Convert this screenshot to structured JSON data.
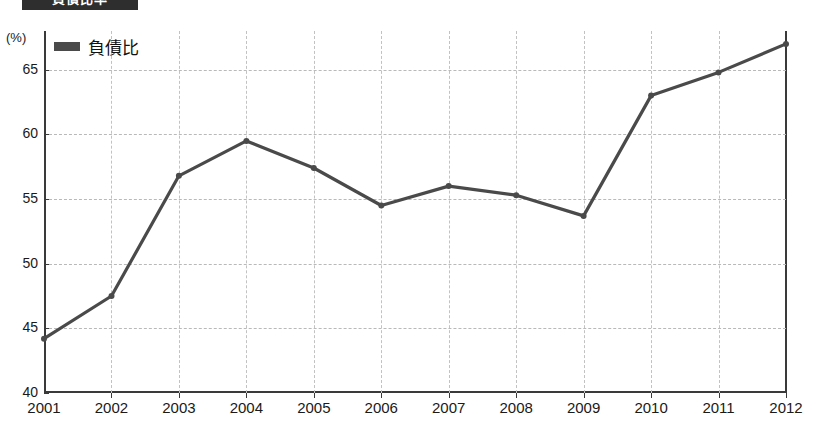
{
  "header": {
    "title_bar_text": "負債比率",
    "title_bar_color": "#2e2e2e"
  },
  "axis": {
    "unit_label": "(%)",
    "y_ticks": [
      "40",
      "45",
      "50",
      "55",
      "60",
      "65"
    ],
    "x_ticks": [
      "2001",
      "2002",
      "2003",
      "2004",
      "2005",
      "2006",
      "2007",
      "2008",
      "2009",
      "2010",
      "2011",
      "2012"
    ]
  },
  "legend": {
    "entries": [
      {
        "label": "負債比",
        "color": "#4a4a4a",
        "marker": "line-swatch"
      }
    ]
  },
  "colors": {
    "line": "#4a4a4a",
    "axis": "#3a3a3a",
    "grid": "#bdbdbd",
    "background": "#ffffff",
    "text": "#1a1a1a"
  },
  "chart_data": {
    "type": "line",
    "title": "負債比率",
    "xlabel": "",
    "ylabel": "(%)",
    "ylim": [
      40,
      68
    ],
    "y_tick_values": [
      40,
      45,
      50,
      55,
      60,
      65
    ],
    "grid": true,
    "legend_position": "top-left",
    "categories": [
      "2001",
      "2002",
      "2003",
      "2004",
      "2005",
      "2006",
      "2007",
      "2008",
      "2009",
      "2010",
      "2011",
      "2012"
    ],
    "series": [
      {
        "name": "負債比",
        "color": "#4a4a4a",
        "values": [
          44.2,
          47.5,
          56.8,
          59.5,
          57.4,
          54.5,
          56.0,
          55.3,
          53.7,
          63.0,
          64.8,
          67.0
        ]
      }
    ]
  }
}
